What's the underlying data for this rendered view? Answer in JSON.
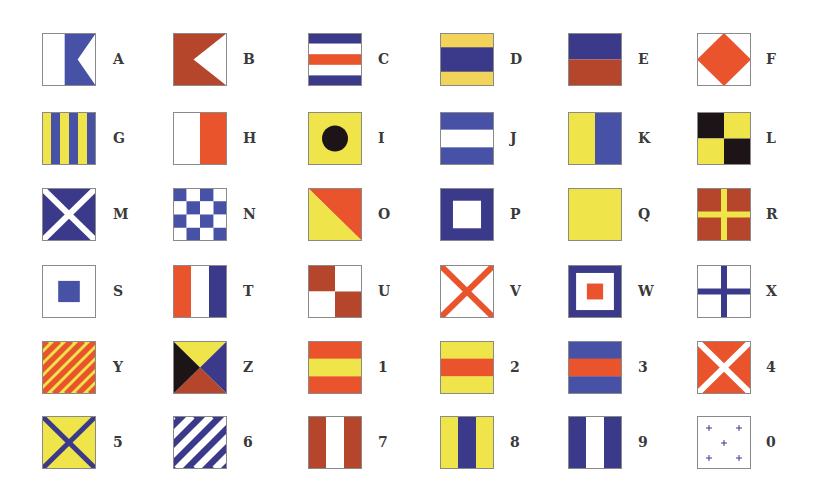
{
  "colors": {
    "navy": "#3b3a8a",
    "blue": "#4752a6",
    "red": "#e9542d",
    "brown": "#b5462b",
    "yellow": "#efe54a",
    "gold": "#f2d45a",
    "black": "#1c1416",
    "white": "#ffffff",
    "border": "#8a8a8a"
  },
  "flags": [
    {
      "label": "A",
      "design": "swallowtail",
      "colors": [
        "white",
        "blue"
      ]
    },
    {
      "label": "B",
      "design": "swallowtail-solid",
      "colors": [
        "brown",
        "white"
      ]
    },
    {
      "label": "C",
      "design": "h-stripes-5",
      "colors": [
        "navy",
        "white",
        "red",
        "white",
        "navy"
      ]
    },
    {
      "label": "D",
      "design": "h-stripes-3-wide",
      "colors": [
        "gold",
        "navy",
        "gold"
      ]
    },
    {
      "label": "E",
      "design": "h-halves",
      "colors": [
        "navy",
        "brown"
      ]
    },
    {
      "label": "F",
      "design": "diamond",
      "colors": [
        "white",
        "red"
      ]
    },
    {
      "label": "G",
      "design": "v-stripes-6",
      "colors": [
        "yellow",
        "blue",
        "yellow",
        "blue",
        "yellow",
        "blue"
      ]
    },
    {
      "label": "H",
      "design": "v-halves",
      "colors": [
        "white",
        "red"
      ]
    },
    {
      "label": "I",
      "design": "disc",
      "colors": [
        "yellow",
        "black"
      ]
    },
    {
      "label": "J",
      "design": "h-stripes-3",
      "colors": [
        "blue",
        "white",
        "blue"
      ]
    },
    {
      "label": "K",
      "design": "v-halves",
      "colors": [
        "yellow",
        "blue"
      ]
    },
    {
      "label": "L",
      "design": "quarters",
      "colors": [
        "black",
        "yellow",
        "yellow",
        "black"
      ]
    },
    {
      "label": "M",
      "design": "saltire",
      "colors": [
        "navy",
        "white"
      ]
    },
    {
      "label": "N",
      "design": "checker-4",
      "colors": [
        "blue",
        "white"
      ]
    },
    {
      "label": "O",
      "design": "diagonal",
      "colors": [
        "red",
        "yellow"
      ]
    },
    {
      "label": "P",
      "design": "square-center",
      "colors": [
        "navy",
        "white"
      ]
    },
    {
      "label": "Q",
      "design": "solid",
      "colors": [
        "yellow"
      ]
    },
    {
      "label": "R",
      "design": "cross",
      "colors": [
        "brown",
        "yellow"
      ]
    },
    {
      "label": "S",
      "design": "square-small",
      "colors": [
        "white",
        "blue"
      ]
    },
    {
      "label": "T",
      "design": "v-stripes-3",
      "colors": [
        "red",
        "white",
        "navy"
      ]
    },
    {
      "label": "U",
      "design": "quarters",
      "colors": [
        "brown",
        "white",
        "white",
        "brown"
      ]
    },
    {
      "label": "V",
      "design": "saltire",
      "colors": [
        "white",
        "red"
      ]
    },
    {
      "label": "W",
      "design": "nested-squares",
      "colors": [
        "navy",
        "white",
        "red"
      ]
    },
    {
      "label": "X",
      "design": "cross",
      "colors": [
        "white",
        "navy"
      ]
    },
    {
      "label": "Y",
      "design": "diagonal-stripes",
      "colors": [
        "yellow",
        "red"
      ]
    },
    {
      "label": "Z",
      "design": "triangles",
      "colors": [
        "yellow",
        "navy",
        "brown",
        "black"
      ]
    },
    {
      "label": "1",
      "design": "h-stripes-3",
      "colors": [
        "red",
        "yellow",
        "red"
      ]
    },
    {
      "label": "2",
      "design": "h-stripes-3",
      "colors": [
        "yellow",
        "red",
        "yellow"
      ]
    },
    {
      "label": "3",
      "design": "h-stripes-3",
      "colors": [
        "blue",
        "red",
        "blue"
      ]
    },
    {
      "label": "4",
      "design": "saltire",
      "colors": [
        "red",
        "white"
      ]
    },
    {
      "label": "5",
      "design": "saltire-thin",
      "colors": [
        "yellow",
        "navy"
      ]
    },
    {
      "label": "6",
      "design": "diagonal-stripes-wide",
      "colors": [
        "navy",
        "white"
      ]
    },
    {
      "label": "7",
      "design": "v-stripes-3",
      "colors": [
        "brown",
        "white",
        "brown"
      ]
    },
    {
      "label": "8",
      "design": "v-stripes-3",
      "colors": [
        "yellow",
        "navy",
        "yellow"
      ]
    },
    {
      "label": "9",
      "design": "v-stripes-3",
      "colors": [
        "navy",
        "white",
        "navy"
      ]
    },
    {
      "label": "0",
      "design": "crosses",
      "colors": [
        "white",
        "navy"
      ]
    }
  ]
}
